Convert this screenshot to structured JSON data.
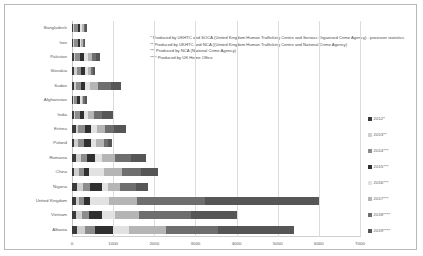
{
  "chart_data": {
    "type": "bar",
    "orientation": "horizontal",
    "stacked": true,
    "title": "",
    "xlabel": "",
    "ylabel": "",
    "xlim": [
      0,
      7000
    ],
    "xticks": [
      "0",
      "1000",
      "2000",
      "3000",
      "4000",
      "5000",
      "6000",
      "7000"
    ],
    "grid": true,
    "legend_position": "right",
    "categories": [
      "Bangladesh",
      "Iran",
      "Pakistan",
      "Slovakia",
      "Sudan",
      "Afghanistan",
      "India",
      "Eritrea",
      "Poland",
      "Romania",
      "China",
      "Nigeria",
      "United Kingdom",
      "Vietnam",
      "Albania"
    ],
    "series": [
      {
        "name": "2012*",
        "color": "#3a3a3a",
        "values": [
          35,
          30,
          45,
          60,
          50,
          30,
          45,
          95,
          55,
          100,
          55,
          110,
          100,
          100,
          120
        ]
      },
      {
        "name": "2013**",
        "color": "#cfcfcf",
        "values": [
          25,
          25,
          30,
          55,
          40,
          20,
          40,
          60,
          100,
          120,
          105,
          160,
          75,
          140,
          190
        ]
      },
      {
        "name": "2014***",
        "color": "#8c8c8c",
        "values": [
          85,
          85,
          110,
          115,
          135,
          80,
          110,
          150,
          130,
          150,
          125,
          165,
          110,
          170,
          260
        ]
      },
      {
        "name": "2015***",
        "color": "#303030",
        "values": [
          60,
          55,
          100,
          95,
          95,
          55,
          95,
          150,
          170,
          185,
          120,
          290,
          165,
          310,
          420
        ]
      },
      {
        "name": "2016***",
        "color": "#e2e2e2",
        "values": [
          45,
          35,
          95,
          70,
          120,
          50,
          110,
          160,
          135,
          175,
          380,
          150,
          440,
          320,
          400
        ]
      },
      {
        "name": "2017***",
        "color": "#b5b5b5",
        "values": [
          40,
          35,
          110,
          60,
          200,
          45,
          140,
          180,
          190,
          310,
          430,
          300,
          700,
          590,
          900
        ]
      },
      {
        "name": "2018****",
        "color": "#6e6e6e",
        "values": [
          35,
          30,
          100,
          55,
          300,
          40,
          200,
          220,
          100,
          390,
          470,
          390,
          1640,
          1260,
          1270
        ]
      },
      {
        "name": "2019****",
        "color": "#565656",
        "values": [
          35,
          30,
          95,
          40,
          260,
          35,
          250,
          290,
          90,
          370,
          400,
          290,
          2770,
          1110,
          1840
        ]
      }
    ],
    "notes": [
      "* Produced by UKHTC  and SOCA (United Kingdom Human Trafficking Centre and Serious Organised Crime Agency) - provision statistics",
      "** Produced by UKHTC and NCA ((United Kingdom Human Trafficking Centre and National Crime Agency)",
      "*** Produced by NCA (National Crime Agency)",
      "**** Produced by UK Home Office"
    ]
  }
}
